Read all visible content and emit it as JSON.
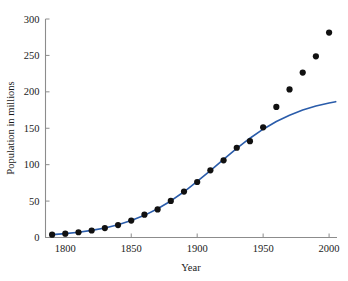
{
  "chart_data": {
    "type": "scatter",
    "title": "",
    "xlabel": "Year",
    "ylabel": "Population in millions",
    "xlim": [
      1785,
      2006
    ],
    "ylim": [
      0,
      300
    ],
    "xticks": [
      1800,
      1850,
      1900,
      1950,
      2000
    ],
    "yticks": [
      0,
      50,
      100,
      150,
      200,
      250,
      300
    ],
    "grid": false,
    "legend": "none",
    "series": [
      {
        "name": "Census data",
        "type": "scatter",
        "marker": "filled-circle",
        "color": "#111111",
        "x": [
          1790,
          1800,
          1810,
          1820,
          1830,
          1840,
          1850,
          1860,
          1870,
          1880,
          1890,
          1900,
          1910,
          1920,
          1930,
          1940,
          1950,
          1960,
          1970,
          1980,
          1990,
          2000
        ],
        "y": [
          3.9,
          5.3,
          7.2,
          9.6,
          12.9,
          17.1,
          23.2,
          31.4,
          38.6,
          50.2,
          63.0,
          76.2,
          92.2,
          106.0,
          123.2,
          132.2,
          151.3,
          179.3,
          203.3,
          226.5,
          248.7,
          281.4
        ]
      },
      {
        "name": "Logistic model fit",
        "type": "line",
        "color": "#2a5caa",
        "x": [
          1790,
          1800,
          1810,
          1820,
          1830,
          1840,
          1850,
          1860,
          1870,
          1880,
          1890,
          1900,
          1910,
          1920,
          1930,
          1940,
          1950,
          1960,
          1970,
          1980,
          1990,
          2000,
          2005
        ],
        "y": [
          3.9,
          5.3,
          7.2,
          9.8,
          13.1,
          17.5,
          23.2,
          30.4,
          39.4,
          50.2,
          62.8,
          76.9,
          91.9,
          107.4,
          122.4,
          136.3,
          148.7,
          159.2,
          167.9,
          174.9,
          180.5,
          184.7,
          186.5
        ]
      }
    ]
  },
  "axis_labels": {
    "x_title": "Year",
    "y_title": "Population in millions",
    "x_ticks": [
      "1800",
      "1850",
      "1900",
      "1950",
      "2000"
    ],
    "y_ticks": [
      "0",
      "50",
      "100",
      "150",
      "200",
      "250",
      "300"
    ]
  },
  "colors": {
    "curve": "#2a5caa",
    "marker": "#111111",
    "axis": "#8c8c8c",
    "text": "#1a1a1a",
    "background": "#ffffff"
  }
}
